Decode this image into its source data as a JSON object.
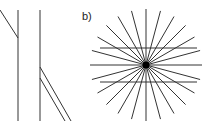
{
  "figure": {
    "panel_a": {
      "label": "",
      "illusion": "Poggendorff",
      "verticals": [
        {
          "x": 18,
          "y1": 10,
          "y2": 121
        },
        {
          "x": 40,
          "y1": 10,
          "y2": 121
        }
      ],
      "diagonals": [
        {
          "x1": 0,
          "y1": 10,
          "x2": 18,
          "y2": 38
        },
        {
          "x1": 40,
          "y1": 67,
          "x2": 71,
          "y2": 121
        },
        {
          "x1": 40,
          "y1": 78,
          "x2": 65,
          "y2": 121
        }
      ],
      "stroke": "#333333"
    },
    "panel_b": {
      "label": "b)",
      "illusion": "Hering",
      "center": {
        "x": 146,
        "y": 65
      },
      "ray_count": 24,
      "ray_length": 56,
      "parallels": [
        {
          "y": 48,
          "x1": 100,
          "x2": 197
        },
        {
          "y": 82,
          "x1": 100,
          "x2": 197
        }
      ],
      "stroke": "#333333"
    }
  }
}
